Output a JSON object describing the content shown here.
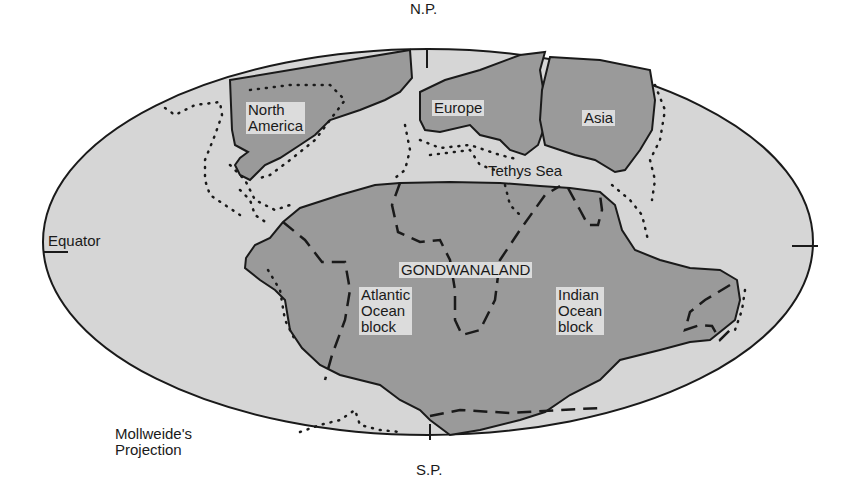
{
  "diagram": {
    "title": "Mollweide's Projection",
    "projection_label_line1": "Mollweide's",
    "projection_label_line2": "Projection",
    "colors": {
      "ocean": "#d6d6d6",
      "land": "#9a9a9a",
      "outline": "#1a1a1a",
      "label_box": "#dcdcdc",
      "background": "#ffffff"
    },
    "poles": {
      "north": "N.P.",
      "south": "S.P."
    },
    "equator_label": "Equator",
    "landmasses": [
      {
        "id": "north-america",
        "line1": "North",
        "line2": "America"
      },
      {
        "id": "europe",
        "label": "Europe"
      },
      {
        "id": "asia",
        "label": "Asia"
      },
      {
        "id": "gondwanaland",
        "label": "GONDWANALAND"
      }
    ],
    "sea": {
      "label": "Tethys Sea"
    },
    "blocks": [
      {
        "id": "atlantic",
        "line1": "Atlantic",
        "line2": "Ocean",
        "line3": "block"
      },
      {
        "id": "indian",
        "line1": "Indian",
        "line2": "Ocean",
        "line3": "block"
      }
    ],
    "legend": {
      "solid_line": "continental outline",
      "dashed_line": "block boundary",
      "dotted_line": "present-day coastline"
    }
  }
}
